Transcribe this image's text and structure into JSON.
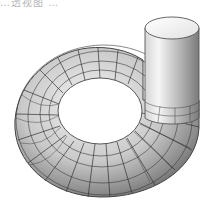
{
  "caption_fragment": "…透视图 …",
  "figure": {
    "style": "pencil-shaded wireframe perspective",
    "components": [
      {
        "name": "spiral-casing-torus",
        "mesh": "wireframe grid"
      },
      {
        "name": "outlet-cylinder",
        "shading": "smooth gradient"
      }
    ],
    "colors": {
      "background": "#ffffff",
      "mesh_line": "#333333",
      "shade_dark": "#6e6e6e",
      "shade_mid": "#b5b5b5",
      "shade_light": "#f2f2f2"
    }
  }
}
